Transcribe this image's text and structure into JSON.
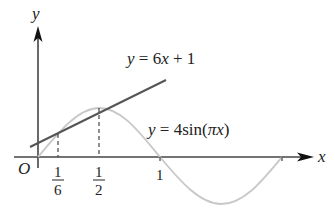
{
  "figure": {
    "type": "function-graph",
    "axes": {
      "x_label": "x",
      "y_label": "y",
      "origin_label": "O"
    },
    "tick_labels": {
      "sixth": {
        "num": "1",
        "den": "6"
      },
      "half": {
        "num": "1",
        "den": "2"
      },
      "one": "1"
    },
    "curves": [
      {
        "name": "line",
        "label": "y = 6x + 1",
        "color": "#555555"
      },
      {
        "name": "sine",
        "label": "y = 4sin(πx)",
        "color": "#c8c8c8"
      }
    ],
    "intersections": [
      {
        "x": "1/6",
        "y": 2
      },
      {
        "x": "1/2",
        "y": 4
      }
    ],
    "colors": {
      "axis": "#444444",
      "line": "#555555",
      "sine": "#c8c8c8",
      "guides": "#333333"
    }
  },
  "labels": {
    "line_eq_prefix": "y",
    "line_eq_rest": " = 6",
    "line_eq_x": "x",
    "line_eq_tail": " + 1",
    "sine_eq_prefix": "y",
    "sine_eq_rest": " = 4sin(",
    "sine_eq_pi": "π",
    "sine_eq_x": "x",
    "sine_eq_tail": ")"
  }
}
